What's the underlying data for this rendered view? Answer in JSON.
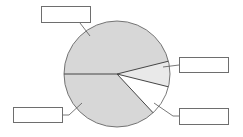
{
  "diagram": {
    "type": "pie-chart-worksheet",
    "center": [
      117,
      74
    ],
    "radius": 53,
    "colors": {
      "slice_dark": "#d7d7d7",
      "slice_light": "#e9e9e9",
      "slice_white": "#ffffff",
      "outline": "#555555",
      "leader": "#555555",
      "box_border": "#6e6e6e"
    },
    "slices": [
      {
        "id": "top",
        "start_deg": 180,
        "end_deg": 346,
        "share_pct": 46,
        "fill": "#d7d7d7",
        "label": ""
      },
      {
        "id": "right-upper",
        "start_deg": 346,
        "end_deg": 374,
        "share_pct": 8,
        "fill": "#e9e9e9",
        "label": ""
      },
      {
        "id": "right-lower",
        "start_deg": 14,
        "end_deg": 47,
        "share_pct": 9,
        "fill": "#ffffff",
        "label": ""
      },
      {
        "id": "bottom",
        "start_deg": 47,
        "end_deg": 180,
        "share_pct": 37,
        "fill": "#d7d7d7",
        "label": ""
      }
    ],
    "label_boxes": [
      {
        "id": "top-left-box",
        "x": 41,
        "y": 6,
        "w": 50,
        "h": 17,
        "text": ""
      },
      {
        "id": "right-upper-box",
        "x": 179,
        "y": 57,
        "w": 50,
        "h": 16,
        "text": ""
      },
      {
        "id": "right-lower-box",
        "x": 179,
        "y": 108,
        "w": 50,
        "h": 17,
        "text": ""
      },
      {
        "id": "bottom-left-box",
        "x": 13,
        "y": 107,
        "w": 50,
        "h": 16,
        "text": ""
      }
    ]
  }
}
